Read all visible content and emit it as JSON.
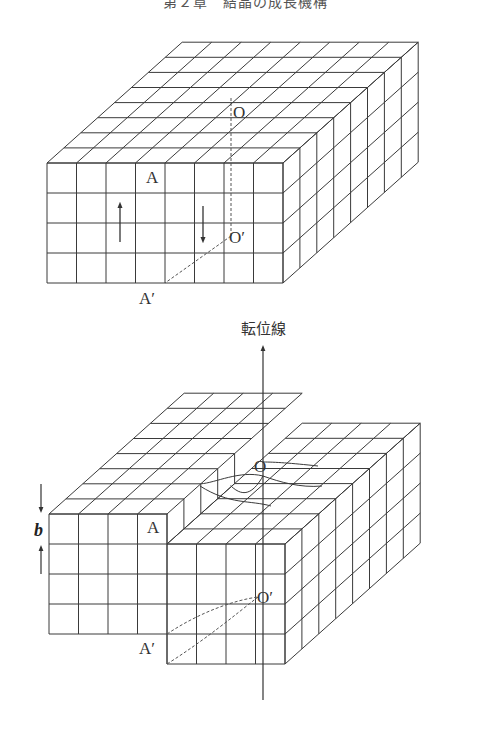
{
  "header": {
    "text": "第２章　結晶の成長機構"
  },
  "colors": {
    "line": "#3a3a3a",
    "dash": "#555555",
    "background": "#ffffff"
  },
  "figure_top": {
    "title": "Perfect crystal block before dislocation",
    "origin": [
      47,
      163
    ],
    "cell_w": 29.5,
    "cell_h": 30,
    "depth_dx": 16.9,
    "depth_dy": -15.1,
    "cols": 8,
    "rows": 4,
    "depth": 8,
    "labels": {
      "A": {
        "text": "A",
        "x": 146,
        "y": 183
      },
      "O": {
        "text": "O",
        "x": 233,
        "y": 118
      },
      "O_prime": {
        "text": "O′",
        "x": 229,
        "y": 243
      },
      "A_prime": {
        "text": "A′",
        "x": 146,
        "y": 304
      }
    },
    "arrows": [
      {
        "name": "up-arrow",
        "x": 120,
        "y1": 242,
        "y2": 203,
        "direction": "up"
      },
      {
        "name": "down-arrow",
        "x": 203,
        "y1": 206,
        "y2": 242,
        "direction": "down"
      }
    ]
  },
  "dislocation_line": {
    "label": "転位線",
    "label_x": 240,
    "label_y": 334,
    "x": 263,
    "y_top": 346,
    "y_bottom": 700
  },
  "figure_bottom": {
    "title": "Crystal block with screw dislocation",
    "left_block": {
      "origin": [
        49,
        514
      ],
      "cols": 4,
      "rows": 4
    },
    "right_block": {
      "origin": [
        167,
        544
      ],
      "cols": 4,
      "rows": 4
    },
    "cell_w": 29.5,
    "cell_h": 30,
    "depth_dx": 16.9,
    "depth_dy": -15.1,
    "depth": 8,
    "labels": {
      "A": {
        "text": "A",
        "x": 147,
        "y": 533
      },
      "O": {
        "text": "O",
        "x": 255,
        "y": 472
      },
      "O_prime": {
        "text": "O′",
        "x": 257,
        "y": 603
      },
      "A_prime": {
        "text": "A′",
        "x": 146,
        "y": 654
      },
      "b": {
        "text": "b",
        "x": 36,
        "y": 537
      }
    },
    "burgers_arrows": [
      {
        "name": "b-down-arrow",
        "x": 41,
        "y1": 484,
        "y2": 510
      },
      {
        "name": "b-up-arrow",
        "x": 41,
        "y1": 573,
        "y2": 546
      }
    ]
  },
  "footer": {
    "text": ""
  }
}
